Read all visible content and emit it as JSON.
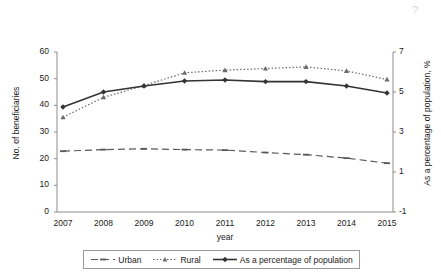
{
  "chart_data": {
    "type": "line",
    "title": "",
    "xlabel": "year",
    "ylabel": "No. of beneficiaries",
    "y2label": "As a percentage of population, %",
    "categories": [
      "2007",
      "2008",
      "2009",
      "2010",
      "2011",
      "2012",
      "2013",
      "2014",
      "2015"
    ],
    "ylim": [
      0,
      60
    ],
    "yticks": [
      0,
      10,
      20,
      30,
      40,
      50,
      60
    ],
    "y2lim": [
      -1,
      7
    ],
    "y2ticks": [
      -1,
      1,
      3,
      5,
      7
    ],
    "grid": false,
    "legend_position": "bottom",
    "series": [
      {
        "name": "Urban",
        "axis": "left",
        "style": "dashed",
        "marker": "dash",
        "color": "#595959",
        "values": [
          22.8,
          23.4,
          23.7,
          23.4,
          23.2,
          22.3,
          21.5,
          20.2,
          18.3
        ]
      },
      {
        "name": "Rural",
        "axis": "left",
        "style": "dotted",
        "marker": "triangle",
        "color": "#6b6b6b",
        "values": [
          35.5,
          43.0,
          47.4,
          52.2,
          53.2,
          53.8,
          54.4,
          52.9,
          49.7
        ]
      },
      {
        "name": "As a percentage of population",
        "axis": "right",
        "style": "solid",
        "marker": "diamond",
        "color": "#333333",
        "values": [
          4.25,
          5.0,
          5.3,
          5.55,
          5.6,
          5.52,
          5.52,
          5.3,
          4.95
        ]
      }
    ]
  },
  "axes": {
    "left_title": "No. of beneficiaries",
    "right_title": "As a percentage of population, %",
    "x_title": "year",
    "left_ticks": [
      "0",
      "10",
      "20",
      "30",
      "40",
      "50",
      "60"
    ],
    "right_ticks": [
      "-1",
      "1",
      "3",
      "5",
      "7"
    ],
    "x_ticks": [
      "2007",
      "2008",
      "2009",
      "2010",
      "2011",
      "2012",
      "2013",
      "2014",
      "2015"
    ]
  },
  "legend": {
    "items": [
      {
        "label": "Urban",
        "marker": "dashed-line-with-arrow-marker"
      },
      {
        "label": "Rural",
        "marker": "dotted-line-with-triangle-marker"
      },
      {
        "label": "As a percentage of population",
        "marker": "solid-line-with-diamond-marker"
      }
    ]
  },
  "artifact": {
    "glyph": "?"
  }
}
